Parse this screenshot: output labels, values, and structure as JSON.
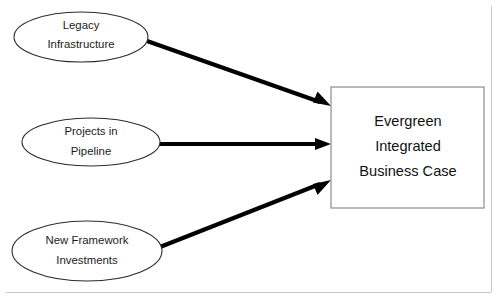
{
  "diagram": {
    "canvas": {
      "width": 500,
      "height": 299,
      "background": "#ffffff"
    },
    "style": {
      "ellipse_stroke": "#2b2b2b",
      "ellipse_fill": "#ffffff",
      "box_stroke": "#8c8c8c",
      "box_fill": "#ffffff",
      "arrow_color": "#000000",
      "text_color": "#1c1c1c",
      "frame_color": "#c9c9c9"
    },
    "source_nodes": [
      {
        "id": "legacy-infrastructure",
        "shape": "ellipse",
        "line1": "Legacy",
        "line2": "Infrastructure",
        "cx": 81,
        "cy": 37,
        "rx": 67,
        "ry": 25
      },
      {
        "id": "projects-in-pipeline",
        "shape": "ellipse",
        "line1": "Projects in",
        "line2": "Pipeline",
        "cx": 91,
        "cy": 142,
        "rx": 69,
        "ry": 24
      },
      {
        "id": "new-framework-investments",
        "shape": "ellipse",
        "line1": "New Framework",
        "line2": "Investments",
        "cx": 87,
        "cy": 251,
        "rx": 75,
        "ry": 30
      }
    ],
    "target_node": {
      "id": "evergreen-integrated-business-case",
      "shape": "rectangle",
      "line1": "Evergreen",
      "line2": "Integrated",
      "line3": "Business Case",
      "x": 331,
      "y": 87,
      "width": 153,
      "height": 121
    },
    "connectors": [
      {
        "id": "arrow-legacy-to-case",
        "from": "legacy-infrastructure",
        "to": "evergreen-integrated-business-case",
        "x1": 147,
        "y1": 41,
        "x2": 331,
        "y2": 106
      },
      {
        "id": "arrow-pipeline-to-case",
        "from": "projects-in-pipeline",
        "to": "evergreen-integrated-business-case",
        "x1": 159,
        "y1": 144,
        "x2": 331,
        "y2": 144
      },
      {
        "id": "arrow-framework-to-case",
        "from": "new-framework-investments",
        "to": "evergreen-integrated-business-case",
        "x1": 160,
        "y1": 247,
        "x2": 331,
        "y2": 180
      }
    ]
  }
}
